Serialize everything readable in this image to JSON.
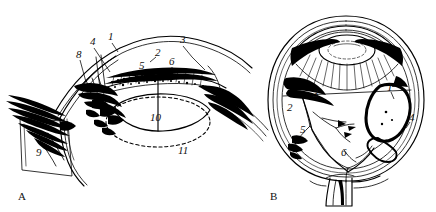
{
  "figure": {
    "type": "anatomical-line-drawing",
    "background_color": "#ffffff",
    "ink_color": "#000000",
    "panels": [
      {
        "id": "A",
        "caption": "A",
        "description": "anterior segment sagittal section",
        "labels": [
          {
            "key": "1",
            "text": "1",
            "x": 110,
            "y": 37
          },
          {
            "key": "2",
            "text": "2",
            "x": 157,
            "y": 53
          },
          {
            "key": "3",
            "text": "3",
            "x": 182,
            "y": 40
          },
          {
            "key": "4",
            "text": "4",
            "x": 92,
            "y": 42
          },
          {
            "key": "5",
            "text": "5",
            "x": 140,
            "y": 66
          },
          {
            "key": "6",
            "text": "6",
            "x": 170,
            "y": 62
          },
          {
            "key": "8",
            "text": "8",
            "x": 78,
            "y": 55
          },
          {
            "key": "9",
            "text": "9",
            "x": 38,
            "y": 153
          },
          {
            "key": "10",
            "text": "10",
            "x": 155,
            "y": 118
          },
          {
            "key": "11",
            "text": "11",
            "x": 181,
            "y": 151
          }
        ]
      },
      {
        "id": "B",
        "caption": "B",
        "description": "whole eyeball sagittal section",
        "labels": [
          {
            "key": "1",
            "text": "1",
            "x": 388,
            "y": 88
          },
          {
            "key": "2",
            "text": "2",
            "x": 289,
            "y": 108
          },
          {
            "key": "3",
            "text": "3",
            "x": 315,
            "y": 94
          },
          {
            "key": "4",
            "text": "4",
            "x": 411,
            "y": 118
          },
          {
            "key": "5",
            "text": "5",
            "x": 302,
            "y": 130
          },
          {
            "key": "6",
            "text": "6",
            "x": 343,
            "y": 153
          }
        ]
      }
    ],
    "captions": [
      {
        "text": "A",
        "x": 18,
        "y": 190
      },
      {
        "text": "B",
        "x": 270,
        "y": 190
      }
    ]
  }
}
